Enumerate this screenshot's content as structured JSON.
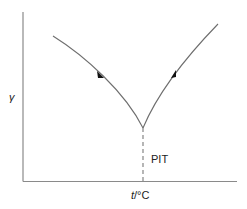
{
  "diagram": {
    "y_axis_label": "γ",
    "x_axis_label_italic": "t",
    "x_axis_label_unit": "/°C",
    "annotation": "PIT",
    "curves": [
      {
        "name": "left-branch",
        "direction": "decreasing toward PIT",
        "arrow": "down-right"
      },
      {
        "name": "right-branch",
        "direction": "increasing away from PIT",
        "arrow": "up-right"
      }
    ],
    "line_color": "#6e6e6e",
    "axis_color": "#8a8a8a"
  }
}
